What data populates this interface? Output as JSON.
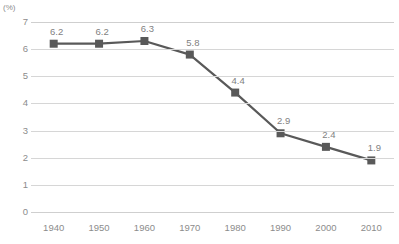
{
  "chart_data": {
    "type": "line",
    "title": "",
    "subtitle": "",
    "xlabel": "",
    "ylabel": "",
    "unit_label": "(%)",
    "categories": [
      "1940",
      "1950",
      "1960",
      "1970",
      "1980",
      "1990",
      "2000",
      "2010"
    ],
    "values": [
      6.2,
      6.2,
      6.3,
      5.8,
      4.4,
      2.9,
      2.4,
      1.9
    ],
    "data_labels": [
      "6.2",
      "6.2",
      "6.3",
      "5.8",
      "4.4",
      "2.9",
      "2.4",
      "1.9"
    ],
    "ylim": [
      0,
      7
    ],
    "ytick_labels": [
      "7",
      "6",
      "5",
      "4",
      "3",
      "2",
      "1",
      "0"
    ],
    "ytick_values": [
      7,
      6,
      5,
      4,
      3,
      2,
      1,
      0
    ],
    "grid": true,
    "grid_axis": "y",
    "legend": false,
    "legend_position": "none",
    "marker": "square",
    "colors": {
      "line": "#595959",
      "marker": "#595959",
      "grid": "#d6d6d6",
      "axis_text": "#8c8c8c",
      "data_label_text": "#7f7f7f",
      "background": "#ffffff"
    }
  }
}
